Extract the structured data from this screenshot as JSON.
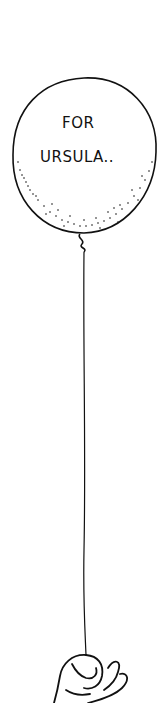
{
  "illustration": {
    "balloon_text_line1": "FOR",
    "balloon_text_line2": "URSULA..",
    "ink_color": "#111111",
    "background_color": "#ffffff"
  }
}
